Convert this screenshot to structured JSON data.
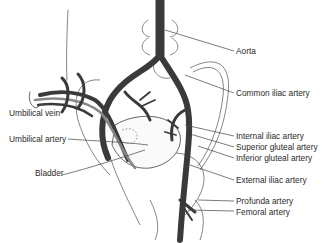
{
  "diagram": {
    "colors": {
      "vessel": "#3a3a3a",
      "outline": "#555555",
      "label": "#2a2a2a",
      "background": "#ffffff"
    },
    "labels_left": [
      {
        "id": "umbilical-vein",
        "text": "Umbilical vein"
      },
      {
        "id": "umbilical-artery",
        "text": "Umbilical artery"
      },
      {
        "id": "bladder",
        "text": "Bladder"
      }
    ],
    "labels_right": [
      {
        "id": "aorta",
        "text": "Aorta"
      },
      {
        "id": "common-iliac-artery",
        "text": "Common iliac artery"
      },
      {
        "id": "internal-iliac-artery",
        "text": "Internal iliac artery"
      },
      {
        "id": "superior-gluteal-artery",
        "text": "Superior gluteal artery"
      },
      {
        "id": "inferior-gluteal-artery",
        "text": "Inferior gluteal artery"
      },
      {
        "id": "external-iliac-artery",
        "text": "External iliac artery"
      },
      {
        "id": "profunda-artery",
        "text": "Profunda artery"
      },
      {
        "id": "femoral-artery",
        "text": "Femoral artery"
      }
    ]
  }
}
